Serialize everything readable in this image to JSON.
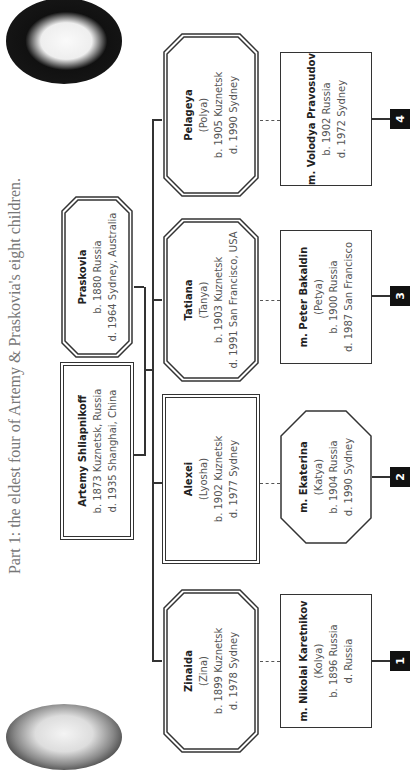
{
  "title": "Part 1: the eldest four of Artemy & Praskovia's eight children.",
  "parents": [
    {
      "name": "Artemy Shliapnikoff",
      "born": "b. 1873 Kuznetsk, Russia",
      "died": "d. 1935 Shanghai, China",
      "shape": "rectangle"
    },
    {
      "name": "Praskovia",
      "born": "b. 1880 Russia",
      "died": "d. 1964 Sydney, Australia",
      "shape": "octagon"
    }
  ],
  "children": [
    {
      "name": "Zinaida",
      "nickname": "(Zina)",
      "born": "b. 1899 Kuznetsk",
      "died": "d. 1978 Sydney",
      "shape": "octagon",
      "spouse": {
        "name": "m. Nikolai Karetnikov",
        "nickname": "(Kolya)",
        "born": "b. 1896 Russia",
        "died": "d. Russia",
        "shape": "rectangle"
      },
      "badge": "1"
    },
    {
      "name": "Alexei",
      "nickname": "(Lyosha)",
      "born": "b. 1902 Kuznetsk",
      "died": "d. 1977 Sydney",
      "shape": "rectangle",
      "spouse": {
        "name": "m. Ekaterina",
        "nickname": "(Katya)",
        "born": "b. 1904 Russia",
        "died": "d. 1990 Sydney",
        "shape": "octagon"
      },
      "badge": "2"
    },
    {
      "name": "Tatiana",
      "nickname": "(Tanya)",
      "born": "b. 1903 Kuznetsk",
      "died": "d. 1991 San Francisco, USA",
      "shape": "octagon",
      "spouse": {
        "name": "m. Peter Bakaldin",
        "nickname": "(Petya)",
        "born": "b. 1900 Russia",
        "died": "d. 1987 San Francisco",
        "shape": "rectangle"
      },
      "badge": "3"
    },
    {
      "name": "Pelageya",
      "nickname": "(Polya)",
      "born": "b. 1905 Kuznetsk",
      "died": "d. 1990 Sydney",
      "shape": "octagon",
      "spouse": {
        "name": "m. Volodya Pravosudov",
        "born": "b. 1902 Russia",
        "died": "d. 1972 Sydney",
        "shape": "rectangle"
      },
      "badge": "4"
    }
  ],
  "photos": [
    {
      "label": "portrait-left"
    },
    {
      "label": "portrait-right"
    }
  ]
}
